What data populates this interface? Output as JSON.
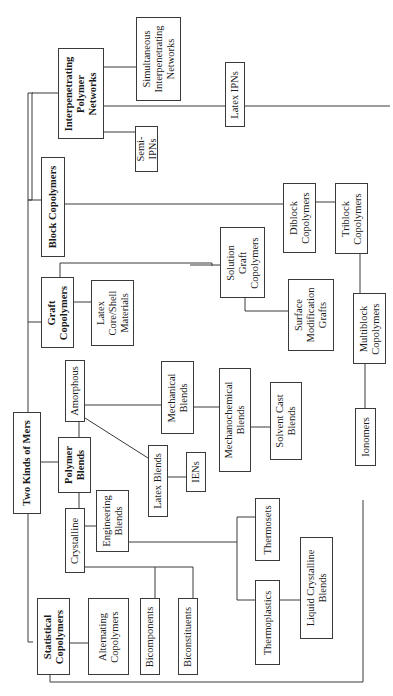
{
  "diagram": {
    "title": "Two Kinds of Mers",
    "orientation": "rotated 90deg counter-clockwise",
    "line_color": "#3a3a3a",
    "nodes": {
      "root": "Two Kinds of Mers",
      "statistical": "Statistical\nCopolymers",
      "alternating": "Alternating\nCopolymers",
      "polymer_blends": "Polymer\nBlends",
      "crystalline": "Crystalline",
      "amorphous": "Amorphous",
      "engineering": "Engineering\nBlends",
      "latex_blends": "Latex Blends",
      "iens": "IENs",
      "mechanical": "Mechanical\nBlends",
      "mechanochemical": "Mechanochemical\nBlends",
      "solvent_cast": "Solvent Cast\nBlends",
      "bicomponents": "Bicomponents",
      "biconstituents": "Biconstituents",
      "thermosets": "Thermosets",
      "thermoplastics": "Thermoplastics",
      "liquid_crystalline": "Liquid Crystalline\nBlends",
      "graft": "Graft\nCopolymers",
      "latex_core_shell": "Latex\nCore/Shell\nMaterials",
      "solution_graft": "Solution\nGraft\nCopolymers",
      "surface_mod": "Surface\nModification\nGrafts",
      "block": "Block Copolymers",
      "diblock": "Diblock\nCopolymers",
      "triblock": "Triblock\nCopolymers",
      "multiblock": "Multiblock\nCopolymers",
      "ionomers": "Ionomers",
      "ipn": "Interpenetrating\nPolymer\nNetworks",
      "simultaneous_ipn": "Simultaneous\nInterpenetrating\nNetworks",
      "semi_ipns": "Semi-\nIPNs",
      "latex_ipns": "Latex IPNs"
    }
  }
}
